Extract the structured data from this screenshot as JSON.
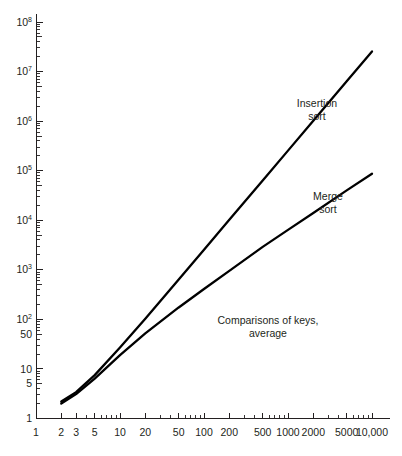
{
  "chart_data": {
    "type": "line",
    "title": "",
    "subtitle": "",
    "annotation_main": "Comparisons of keys,",
    "annotation_main_line2": "average",
    "xlabel": "",
    "ylabel": "",
    "xscale": "log",
    "yscale": "log",
    "xlim": [
      1,
      16000
    ],
    "ylim": [
      1,
      200000000
    ],
    "grid": false,
    "legend_position": "inline-labels",
    "x_tick_labels": [
      "1",
      "2",
      "3",
      "5",
      "10",
      "20",
      "50",
      "100",
      "200",
      "500",
      "1000",
      "2000",
      "5000",
      "10,000"
    ],
    "x_tick_values": [
      1,
      2,
      3,
      5,
      10,
      20,
      50,
      100,
      200,
      500,
      1000,
      2000,
      5000,
      10000
    ],
    "y_tick_labels": [
      "1",
      "5",
      "10",
      "50",
      "10²",
      "10³",
      "10⁴",
      "10⁵",
      "10⁶",
      "10⁷",
      "10⁸"
    ],
    "y_tick_values": [
      1,
      5,
      10,
      50,
      100,
      1000,
      10000,
      100000,
      1000000,
      10000000,
      100000000
    ],
    "y_tick_mantissa": [
      "1",
      "5",
      "10",
      "50",
      "10",
      "10",
      "10",
      "10",
      "10",
      "10",
      "10"
    ],
    "y_tick_exponent": [
      "",
      "",
      "",
      "",
      "2",
      "3",
      "4",
      "5",
      "6",
      "7",
      "8"
    ],
    "series": [
      {
        "name": "Insertion sort",
        "label_line1": "Insertion",
        "label_line2": "sort",
        "color": "#000000",
        "x": [
          2,
          3,
          5,
          10,
          20,
          50,
          100,
          200,
          500,
          1000,
          2000,
          5000,
          10000
        ],
        "values": [
          2.2,
          3.4,
          7.5,
          27,
          103,
          640,
          2550,
          10200,
          63500,
          254000,
          1020000,
          6350000,
          25400000
        ]
      },
      {
        "name": "Merge sort",
        "label_line1": "Merge",
        "label_line2": "sort",
        "color": "#000000",
        "x": [
          2,
          3,
          5,
          10,
          20,
          50,
          100,
          200,
          500,
          1000,
          2000,
          5000,
          10000
        ],
        "values": [
          2.0,
          3.1,
          6.4,
          19,
          52,
          174,
          410,
          950,
          2900,
          6400,
          14000,
          40000,
          87000
        ]
      }
    ]
  },
  "annotations": {
    "insertion_label_1": "Insertion",
    "insertion_label_2": "sort",
    "merge_label_1": "Merge",
    "merge_label_2": "sort",
    "center_label_1": "Comparisons of keys,",
    "center_label_2": "average"
  }
}
